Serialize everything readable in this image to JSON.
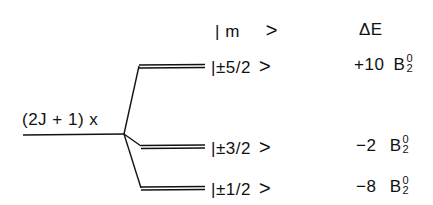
{
  "diagram": {
    "type": "energy-level-splitting",
    "unsplit_level": {
      "label": "(2J + 1) x"
    },
    "headers": {
      "state": "| m",
      "state_close": ">",
      "energy": "ΔE"
    },
    "levels": [
      {
        "state_prefix": "|",
        "state_value": "±5/2",
        "state_close": ">",
        "coefficient": "+10",
        "symbol": "B",
        "superscript": "0",
        "subscript": "2"
      },
      {
        "state_prefix": "|",
        "state_value": "±3/2",
        "state_close": ">",
        "coefficient": "−2",
        "symbol": "B",
        "superscript": "0",
        "subscript": "2"
      },
      {
        "state_prefix": "|",
        "state_value": "±1/2",
        "state_close": ">",
        "coefficient": "−8",
        "symbol": "B",
        "superscript": "0",
        "subscript": "2"
      }
    ],
    "line_color": "#111111"
  }
}
